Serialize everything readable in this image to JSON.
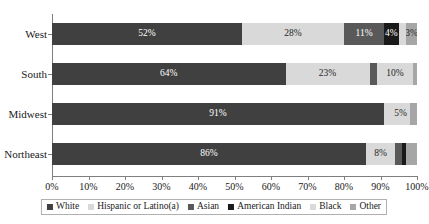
{
  "chart_data": {
    "type": "bar",
    "orientation": "horizontal",
    "stacked": true,
    "normalized": true,
    "title": "",
    "xlabel": "",
    "ylabel": "",
    "xlim": [
      0,
      100
    ],
    "grid": false,
    "legend_position": "bottom",
    "categories": [
      "West",
      "South",
      "Midwest",
      "Northeast"
    ],
    "xticks": [
      0,
      10,
      20,
      30,
      40,
      50,
      60,
      70,
      80,
      90,
      100
    ],
    "xtick_labels": [
      "0%",
      "10%",
      "20%",
      "30%",
      "40%",
      "50%",
      "60%",
      "70%",
      "80%",
      "90%",
      "100%"
    ],
    "series": [
      {
        "name": "White",
        "color": "#404040",
        "values": [
          52,
          64,
          91,
          86
        ],
        "data_labels": [
          "52%",
          "64%",
          "91%",
          "86%"
        ]
      },
      {
        "name": "Hispanic or Latino(a)",
        "color": "#d9d9d9",
        "values": [
          28,
          23,
          2,
          8
        ],
        "data_labels": [
          "28%",
          "23%",
          "",
          "8%"
        ]
      },
      {
        "name": "Asian",
        "color": "#595959",
        "values": [
          11,
          2,
          0,
          2
        ],
        "data_labels": [
          "11%",
          "",
          "",
          ""
        ]
      },
      {
        "name": "American Indian",
        "color": "#1a1a1a",
        "values": [
          4,
          0,
          0,
          1
        ],
        "data_labels": [
          "4%",
          "",
          "",
          ""
        ]
      },
      {
        "name": "Black",
        "color": "#d9d9d9",
        "values": [
          2,
          10,
          5,
          0
        ],
        "data_labels": [
          "",
          "10%",
          "5%",
          ""
        ]
      },
      {
        "name": "Other",
        "color": "#a6a6a6",
        "values": [
          3,
          1,
          2,
          3
        ],
        "data_labels": [
          "3%",
          "",
          "",
          ""
        ]
      }
    ]
  },
  "axis": {
    "tick_labels": [
      "0%",
      "10%",
      "20%",
      "30%",
      "40%",
      "50%",
      "60%",
      "70%",
      "80%",
      "90%",
      "100%"
    ],
    "category_labels": [
      "West",
      "South",
      "Midwest",
      "Northeast"
    ]
  },
  "legend": {
    "items": [
      {
        "label": "White",
        "color": "#404040"
      },
      {
        "label": "Hispanic or Latino(a)",
        "color": "#d9d9d9"
      },
      {
        "label": "Asian",
        "color": "#595959"
      },
      {
        "label": "American Indian",
        "color": "#1a1a1a"
      },
      {
        "label": "Black",
        "color": "#d9d9d9"
      },
      {
        "label": "Other",
        "color": "#a6a6a6"
      }
    ]
  }
}
